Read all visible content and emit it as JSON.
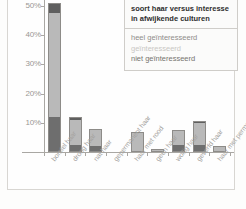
{
  "chart_data": {
    "type": "bar",
    "stacked": true,
    "title": "soort haar versus interesse in afwijkende culturen",
    "xlabel": "",
    "ylabel": "",
    "ylim": [
      0,
      52
    ],
    "ytick_labels": [
      "10%",
      "20%",
      "30%",
      "40%",
      "50%"
    ],
    "ytick_values": [
      10,
      20,
      30,
      40,
      50
    ],
    "grid": false,
    "legend_position": "top-right",
    "categories": [
      "borstel haar",
      "droog haar",
      "nat haar",
      "gepermanent haar",
      "haar met rood",
      "geen haar",
      "wollig haar",
      "geverfd haar",
      "haar met permanent"
    ],
    "series": [
      {
        "name": "heel geïnteresseerd",
        "color": "#6e6e6e",
        "values": [
          12.0,
          2.5,
          2.0,
          0,
          0.4,
          0.3,
          2.5,
          2.5,
          0.3
        ]
      },
      {
        "name": "geïnteresseerd",
        "color": "#b9b9b9",
        "values": [
          35.5,
          8.5,
          5.5,
          0,
          6.3,
          0.7,
          5.0,
          7.3,
          1.7
        ]
      },
      {
        "name": "niet geïnteresseerd",
        "color": "#5f5f5f",
        "values": [
          3.5,
          1.0,
          0.5,
          0,
          0.3,
          0,
          0,
          0.7,
          0
        ]
      }
    ],
    "totals": [
      51.0,
      12.0,
      8.0,
      0,
      7.0,
      1.0,
      7.5,
      10.5,
      2.0
    ]
  },
  "legend": {
    "title_line_1": "soort haar versus interesse",
    "title_line_2": "in afwijkende culturen",
    "items": [
      {
        "label": "heel geïnteresseerd"
      },
      {
        "label": "geïnteresseerd"
      },
      {
        "label": "niet geïnteresseerd"
      }
    ]
  }
}
